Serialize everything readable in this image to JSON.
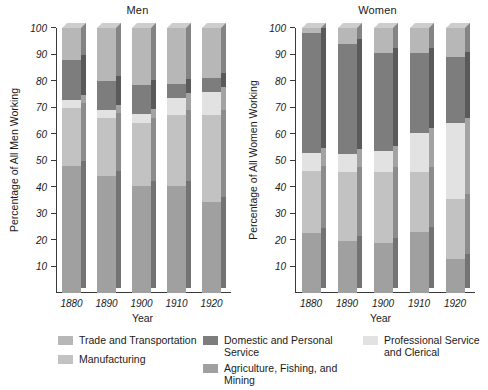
{
  "chart_data": {
    "type": "bar",
    "subtype": "stacked-bar",
    "title": "",
    "panels": [
      {
        "title": "Men",
        "xlabel": "Year",
        "ylabel": "Percentage of All Men Working",
        "categories": [
          "1880",
          "1890",
          "1900",
          "1910",
          "1920"
        ],
        "ylim": [
          0,
          100
        ],
        "yticks": [
          10,
          20,
          30,
          40,
          50,
          60,
          70,
          80,
          90,
          100
        ],
        "grid": false,
        "series": [
          {
            "name": "Agriculture, Fishing, and Mining",
            "values": [
              48,
              44,
              40.5,
              40.5,
              34.5
            ]
          },
          {
            "name": "Manufacturing",
            "values": [
              22,
              22,
              23.5,
              26.5,
              32.5
            ]
          },
          {
            "name": "Professional Service and Clerical",
            "values": [
              3,
              3,
              3.5,
              6.5,
              9
            ]
          },
          {
            "name": "Domestic and Personal Service",
            "values": [
              15,
              11,
              11,
              5.5,
              5
            ]
          },
          {
            "name": "Trade and Transportation",
            "values": [
              12,
              20,
              21.5,
              21,
              19
            ]
          }
        ]
      },
      {
        "title": "Women",
        "xlabel": "Year",
        "ylabel": "Percentage of All Women Working",
        "categories": [
          "1880",
          "1890",
          "1900",
          "1910",
          "1920"
        ],
        "ylim": [
          0,
          100
        ],
        "yticks": [
          10,
          20,
          30,
          40,
          50,
          60,
          70,
          80,
          90,
          100
        ],
        "grid": false,
        "series": [
          {
            "name": "Agriculture, Fishing, and Mining",
            "values": [
              22.5,
              19.5,
              19,
              23,
              13
            ]
          },
          {
            "name": "Manufacturing",
            "values": [
              23.5,
              26,
              26.5,
              22.5,
              22.5
            ]
          },
          {
            "name": "Professional Service and Clerical",
            "values": [
              7,
              7,
              8,
              15,
              28.5
            ]
          },
          {
            "name": "Domestic and Personal Service",
            "values": [
              45,
              41.5,
              37,
              30,
              25
            ]
          },
          {
            "name": "Trade and Transportation",
            "values": [
              2,
              6,
              9.5,
              9.5,
              11
            ]
          }
        ]
      }
    ],
    "legend": {
      "position": "bottom",
      "entries": [
        {
          "label": "Trade and Transportation",
          "color": "#b7b7b7"
        },
        {
          "label": "Manufacturing",
          "color": "#c2c2c2"
        },
        {
          "label": "Domestic and Personal Service",
          "color": "#7d7d7d"
        },
        {
          "label": "Agriculture, Fishing, and Mining",
          "color": "#a0a0a0"
        },
        {
          "label": "Professional Service\nand Clerical",
          "color": "#e2e2e2"
        }
      ]
    },
    "colors": {
      "trade_and_transportation": "#b7b7b7",
      "manufacturing": "#c2c2c2",
      "domestic_and_personal_service": "#7d7d7d",
      "agriculture_fishing_mining": "#a0a0a0",
      "professional_service_and_clerical": "#e2e2e2",
      "axis": "#3a3a3a",
      "text": "#1a1a1a",
      "background": "#ffffff"
    }
  },
  "legend_labels": {
    "trade": "Trade and Transportation",
    "manufacturing": "Manufacturing",
    "domestic": "Domestic and Personal Service",
    "agriculture": "Agriculture, Fishing, and Mining",
    "professional_line1": "Professional Service",
    "professional_line2": "and Clerical"
  }
}
